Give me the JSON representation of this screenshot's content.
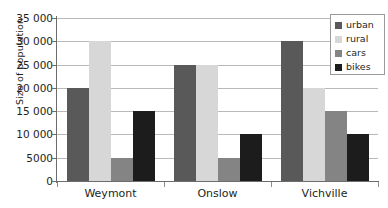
{
  "chart_data": {
    "type": "bar",
    "title": "",
    "xlabel": "",
    "ylabel": "Size of population",
    "categories": [
      "Weymont",
      "Onslow",
      "Vichville"
    ],
    "series": [
      {
        "name": "urban",
        "color": "#595959",
        "values": [
          20000,
          25000,
          30000
        ]
      },
      {
        "name": "rural",
        "color": "#d7d7d7",
        "values": [
          30000,
          25000,
          20000
        ]
      },
      {
        "name": "cars",
        "color": "#848484",
        "values": [
          5000,
          5000,
          15000
        ]
      },
      {
        "name": "bikes",
        "color": "#1c1c1c",
        "values": [
          15000,
          10000,
          10000
        ]
      }
    ],
    "ylim": [
      0,
      35000
    ],
    "ytick_values": [
      0,
      5000,
      10000,
      15000,
      20000,
      25000,
      30000,
      35000
    ],
    "ytick_labels": [
      "0",
      "5000",
      "10 000",
      "15 000",
      "20 000",
      "25 000",
      "30 000",
      "35 000"
    ],
    "grid": true,
    "grid_axis": "y",
    "legend_position": "top-right",
    "legend_entries": [
      "urban",
      "rural",
      "cars",
      "bikes"
    ]
  }
}
